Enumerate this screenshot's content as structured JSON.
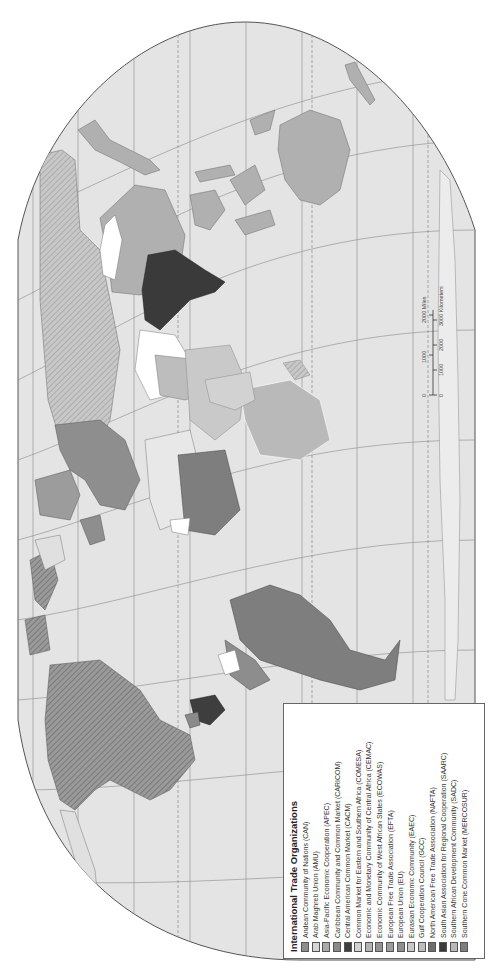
{
  "map": {
    "title": "International Trade Organizations",
    "orientation": "rotated 90° counterclockwise",
    "colors": {
      "ocean": "#e4e4e4",
      "outside": "#ffffff",
      "graticule": "#8a8a8a",
      "coast": "#6a6a6a",
      "land_default": "#e0e0e0",
      "land_white": "#ffffff"
    }
  },
  "legend": {
    "title": "International Trade Organizations",
    "items": [
      {
        "label": "Andean Community of Nations (CAN)",
        "color": "#8d8d8d"
      },
      {
        "label": "Arab Maghreb Union (AMU)",
        "color": "#d6d6d6"
      },
      {
        "label": "Asia-Pacific Economic Cooperation (APEC)",
        "color": "#a9a9a9"
      },
      {
        "label": "Caribbean Community and Common Market (CARICOM)",
        "color": "#8a8a8a"
      },
      {
        "label": "Central American Common Market (CACM)",
        "color": "#3e3e3e"
      },
      {
        "label": "Common Market for Eastern and Southern Africa (COMESA)",
        "color": "#d2d2d2"
      },
      {
        "label": "Economic and Monetary Community of Central Africa (CEMAC)",
        "color": "#b4b4b4"
      },
      {
        "label": "Economic Community of West African States (ECOWAS)",
        "color": "#929292"
      },
      {
        "label": "European Free Trade Association (EFTA)",
        "color": "#9c9c9c"
      },
      {
        "label": "European Union (EU)",
        "color": "#8e8e8e"
      },
      {
        "label": "Eurasian Economic Community (EAEC)",
        "color": "#c9c9c9"
      },
      {
        "label": "Gulf Cooperation Council (GCC)",
        "color": "#bdbdbd"
      },
      {
        "label": "North American Free Trade Association (NAFTA)",
        "color": "#6e6e6e"
      },
      {
        "label": "South Asian Association for Regional Cooperation (SAARC)",
        "color": "#3a3a3a"
      },
      {
        "label": "Southern African Development Community (SADC)",
        "color": "#b9b9b9"
      },
      {
        "label": "Southern Cone Common Market (MERCOSUR)",
        "color": "#7e7e7e"
      }
    ]
  },
  "scale_bar": {
    "miles_labels": [
      "0",
      "1000",
      "2000 Miles"
    ],
    "km_labels": [
      "0",
      "1000",
      "2000",
      "3000 Kilometers"
    ]
  }
}
